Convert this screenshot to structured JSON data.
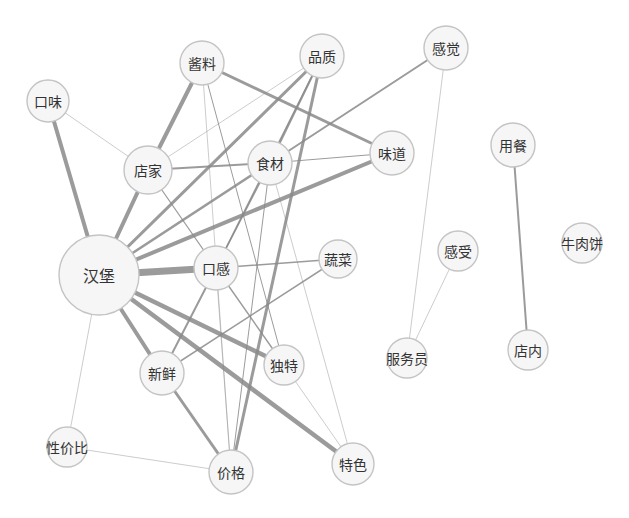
{
  "diagram": {
    "type": "co-occurrence-network",
    "nodes": [
      {
        "id": "hanbao",
        "label": "汉堡",
        "x": 99,
        "y": 275,
        "r": 40,
        "font": 16
      },
      {
        "id": "kouwei",
        "label": "口味",
        "x": 48,
        "y": 101,
        "r": 21,
        "font": 14
      },
      {
        "id": "jiangliao",
        "label": "酱料",
        "x": 202,
        "y": 63,
        "r": 22,
        "font": 14
      },
      {
        "id": "pinzhi",
        "label": "品质",
        "x": 322,
        "y": 56,
        "r": 22,
        "font": 14
      },
      {
        "id": "ganjue",
        "label": "感觉",
        "x": 446,
        "y": 48,
        "r": 22,
        "font": 14
      },
      {
        "id": "dianjia",
        "label": "店家",
        "x": 148,
        "y": 170,
        "r": 24,
        "font": 14
      },
      {
        "id": "shicai",
        "label": "食材",
        "x": 270,
        "y": 163,
        "r": 22,
        "font": 14
      },
      {
        "id": "weidao",
        "label": "味道",
        "x": 392,
        "y": 153,
        "r": 22,
        "font": 14
      },
      {
        "id": "kougan",
        "label": "口感",
        "x": 216,
        "y": 268,
        "r": 22,
        "font": 14
      },
      {
        "id": "shucai",
        "label": "蔬菜",
        "x": 338,
        "y": 259,
        "r": 19,
        "font": 14
      },
      {
        "id": "xinxian",
        "label": "新鲜",
        "x": 162,
        "y": 373,
        "r": 22,
        "font": 14
      },
      {
        "id": "dute",
        "label": "独特",
        "x": 284,
        "y": 365,
        "r": 20,
        "font": 14
      },
      {
        "id": "xingjiabi",
        "label": "性价比",
        "x": 67,
        "y": 447,
        "r": 20,
        "font": 14
      },
      {
        "id": "jiage",
        "label": "价格",
        "x": 231,
        "y": 472,
        "r": 22,
        "font": 14
      },
      {
        "id": "tese",
        "label": "特色",
        "x": 353,
        "y": 464,
        "r": 21,
        "font": 14
      },
      {
        "id": "yongcan",
        "label": "用餐",
        "x": 513,
        "y": 145,
        "r": 22,
        "font": 14
      },
      {
        "id": "ganshou",
        "label": "感受",
        "x": 458,
        "y": 251,
        "r": 20,
        "font": 14
      },
      {
        "id": "niuroubing",
        "label": "牛肉饼",
        "x": 582,
        "y": 243,
        "r": 20,
        "font": 14
      },
      {
        "id": "fuwuyuan",
        "label": "服务员",
        "x": 407,
        "y": 358,
        "r": 20,
        "font": 14
      },
      {
        "id": "diannei",
        "label": "店内",
        "x": 528,
        "y": 350,
        "r": 20,
        "font": 14
      }
    ],
    "edges": [
      {
        "source": "hanbao",
        "target": "kouwei",
        "weight": 4
      },
      {
        "source": "hanbao",
        "target": "dianjia",
        "weight": 4
      },
      {
        "source": "hanbao",
        "target": "kougan",
        "weight": 7
      },
      {
        "source": "hanbao",
        "target": "pinzhi",
        "weight": 3
      },
      {
        "source": "hanbao",
        "target": "shicai",
        "weight": 2.5
      },
      {
        "source": "hanbao",
        "target": "weidao",
        "weight": 4
      },
      {
        "source": "hanbao",
        "target": "xinxian",
        "weight": 4
      },
      {
        "source": "hanbao",
        "target": "dute",
        "weight": 4.5
      },
      {
        "source": "hanbao",
        "target": "tese",
        "weight": 4.5
      },
      {
        "source": "hanbao",
        "target": "xingjiabi",
        "weight": 0.8
      },
      {
        "source": "kouwei",
        "target": "dianjia",
        "weight": 0.8
      },
      {
        "source": "dianjia",
        "target": "jiangliao",
        "weight": 4
      },
      {
        "source": "dianjia",
        "target": "shicai",
        "weight": 2
      },
      {
        "source": "dianjia",
        "target": "pinzhi",
        "weight": 0.8
      },
      {
        "source": "dianjia",
        "target": "kougan",
        "weight": 1.2
      },
      {
        "source": "jiangliao",
        "target": "weidao",
        "weight": 3
      },
      {
        "source": "jiangliao",
        "target": "dute",
        "weight": 1
      },
      {
        "source": "jiangliao",
        "target": "jiage",
        "weight": 0.8
      },
      {
        "source": "pinzhi",
        "target": "shicai",
        "weight": 2
      },
      {
        "source": "pinzhi",
        "target": "jiage",
        "weight": 3
      },
      {
        "source": "pinzhi",
        "target": "kougan",
        "weight": 1.5
      },
      {
        "source": "shicai",
        "target": "weidao",
        "weight": 1
      },
      {
        "source": "shicai",
        "target": "ganjue",
        "weight": 2
      },
      {
        "source": "shicai",
        "target": "kougan",
        "weight": 1.5
      },
      {
        "source": "shicai",
        "target": "jiage",
        "weight": 1
      },
      {
        "source": "shicai",
        "target": "tese",
        "weight": 0.8
      },
      {
        "source": "kougan",
        "target": "shucai",
        "weight": 1.5
      },
      {
        "source": "kougan",
        "target": "xinxian",
        "weight": 2
      },
      {
        "source": "kougan",
        "target": "dute",
        "weight": 1.5
      },
      {
        "source": "kougan",
        "target": "jiage",
        "weight": 0.8
      },
      {
        "source": "shucai",
        "target": "xinxian",
        "weight": 1.5
      },
      {
        "source": "xinxian",
        "target": "jiage",
        "weight": 3
      },
      {
        "source": "dute",
        "target": "tese",
        "weight": 0.8
      },
      {
        "source": "xingjiabi",
        "target": "jiage",
        "weight": 0.8
      },
      {
        "source": "ganjue",
        "target": "fuwuyuan",
        "weight": 0.8
      },
      {
        "source": "ganshou",
        "target": "fuwuyuan",
        "weight": 0.8
      },
      {
        "source": "yongcan",
        "target": "diannei",
        "weight": 2
      }
    ],
    "colors": {
      "background": "#ffffff",
      "node_fill": "#f6f6f6",
      "node_stroke": "#c4c4c4",
      "edge": "#8a8a8a",
      "label": "#333333"
    }
  }
}
